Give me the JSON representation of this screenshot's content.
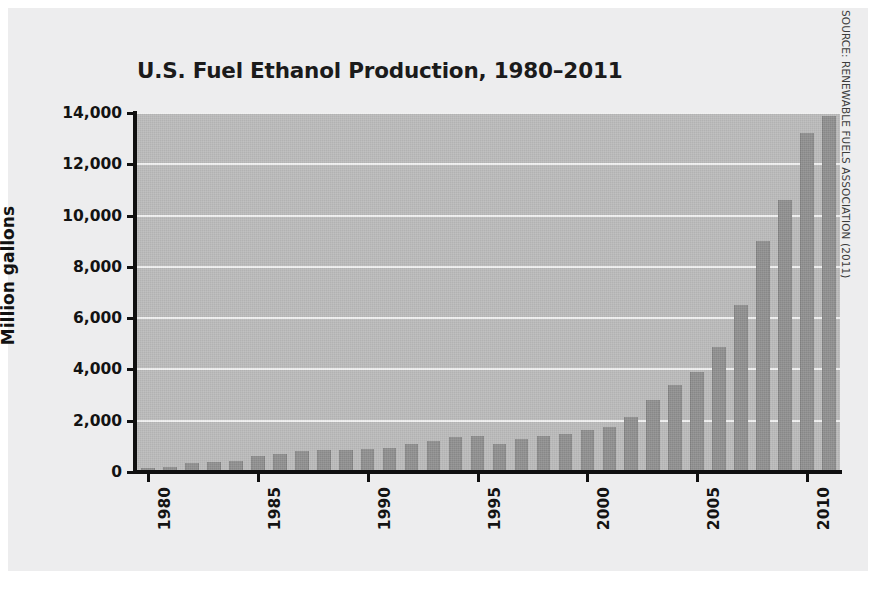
{
  "chart_data": {
    "type": "bar",
    "title": "U.S. Fuel Ethanol Production, 1980–2011",
    "xlabel": "",
    "ylabel": "Million gallons",
    "ylim": [
      0,
      14000
    ],
    "ytick_labels": [
      "14,000",
      "12,000",
      "10,000",
      "8,000",
      "6,000",
      "4,000",
      "2,000",
      "0"
    ],
    "ytick_values": [
      14000,
      12000,
      10000,
      8000,
      6000,
      4000,
      2000,
      0
    ],
    "xtick_labels": [
      "1980",
      "1985",
      "1990",
      "1995",
      "2000",
      "2005",
      "2010"
    ],
    "xtick_values": [
      1980,
      1985,
      1990,
      1995,
      2000,
      2005,
      2010
    ],
    "grid": true,
    "legend": null,
    "categories": [
      "1980",
      "1981",
      "1982",
      "1983",
      "1984",
      "1985",
      "1986",
      "1987",
      "1988",
      "1989",
      "1990",
      "1991",
      "1992",
      "1993",
      "1994",
      "1995",
      "1996",
      "1997",
      "1998",
      "1999",
      "2000",
      "2001",
      "2002",
      "2003",
      "2004",
      "2005",
      "2006",
      "2007",
      "2008",
      "2009",
      "2010",
      "2011"
    ],
    "values": [
      175,
      215,
      350,
      375,
      430,
      610,
      710,
      830,
      845,
      870,
      900,
      950,
      1100,
      1200,
      1350,
      1400,
      1100,
      1300,
      1400,
      1470,
      1630,
      1770,
      2130,
      2800,
      3400,
      3904,
      4884,
      6500,
      9000,
      10600,
      13230,
      13900
    ],
    "bar_color": "#8d8d8d",
    "panel_color": "#b9b9b9",
    "gridline_color": "#f0f0f0",
    "axis_color": "#101010",
    "text_color": "#131313",
    "background_color": "#ededee",
    "source": "SOURCE: RENEWABLE FUELS ASSOCIATION (2011)"
  }
}
